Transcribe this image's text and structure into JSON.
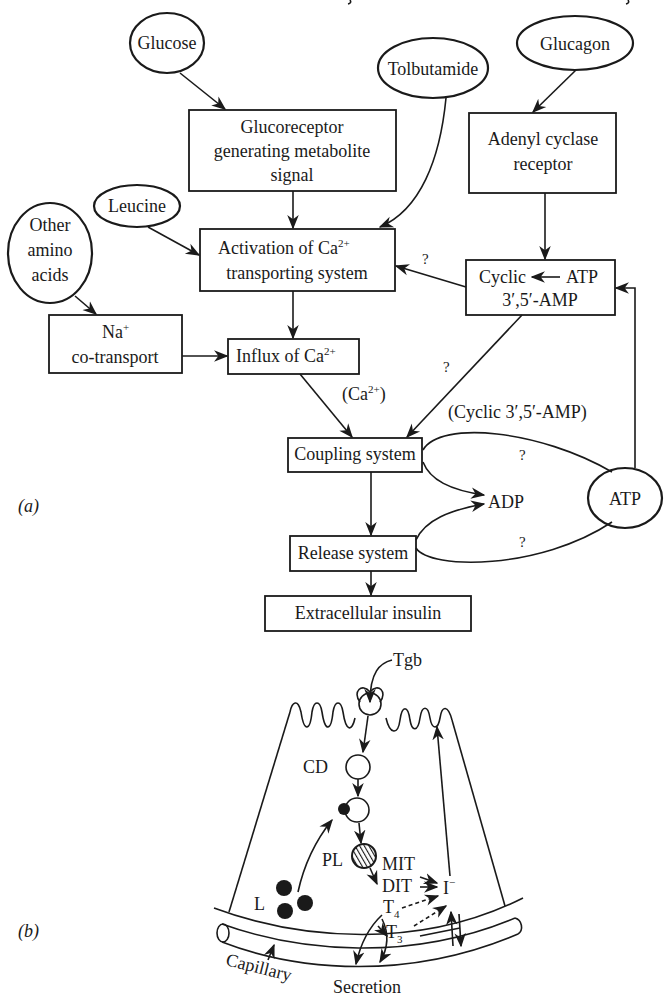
{
  "figure": {
    "panel_a_label": "(a)",
    "panel_b_label": "(b)"
  },
  "panel_a": {
    "inputs": {
      "glucose": "Glucose",
      "tolbutamide": "Tolbutamide",
      "glucagon": "Glucagon",
      "leucine": "Leucine",
      "other_amino_acids": [
        "Other",
        "amino",
        "acids"
      ],
      "atp_node": "ATP"
    },
    "boxes": {
      "glucoreceptor": [
        "Glucoreceptor",
        "generating metabolite",
        "signal"
      ],
      "adenyl_cyclase": [
        "Adenyl cyclase",
        "receptor"
      ],
      "activation": [
        "Activation of Ca",
        "transporting system"
      ],
      "activation_sup": "2+",
      "cyclic_amp_line1_left": "Cyclic",
      "cyclic_amp_line1_right": "ATP",
      "cyclic_amp_line2": "3′,5′-AMP",
      "na_cotransport_line1": "Na",
      "na_cotransport_sup": "+",
      "na_cotransport_line2": "co-transport",
      "influx": "Influx of Ca",
      "influx_sup": "2+",
      "coupling": "Coupling system",
      "release": "Release system",
      "extracellular": "Extracellular insulin"
    },
    "edge_labels": {
      "ca_label": "(Ca",
      "ca_sup": "2+",
      "ca_close": ")",
      "cyclic_amp_label": "(Cyclic 3′,5′-AMP)",
      "question": "?",
      "adp": "ADP"
    }
  },
  "panel_b": {
    "labels": {
      "tgb": "Tgb",
      "cd": "CD",
      "pl": "PL",
      "l": "L",
      "mit": "MIT",
      "dit": "DIT",
      "iodide": "I",
      "iodide_sup": "−",
      "t4": "T",
      "t4_sub": "4",
      "t3": "T",
      "t3_sub": "3",
      "capillary": "Capillary",
      "secretion": "Secretion"
    }
  }
}
